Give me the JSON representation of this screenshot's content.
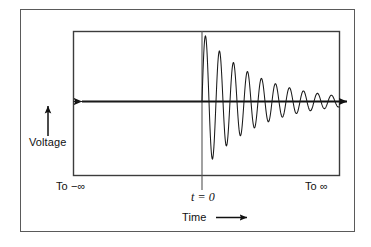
{
  "figure": {
    "background_color": "#ffffff",
    "line_color": "#1a1a1a",
    "frame_color": "#4a4a4a",
    "labels": {
      "y_axis": "Voltage",
      "x_axis": "Time",
      "left_limit": "To −∞",
      "right_limit": "To ∞",
      "origin_marker": "t = 0"
    },
    "icons": {
      "voltage_arrow": "arrow-up-icon",
      "time_arrow": "arrow-right-icon",
      "axis_left_arrow": "arrow-left-icon",
      "axis_right_arrow": "arrow-right-icon"
    }
  },
  "chart_data": {
    "type": "line",
    "title": "",
    "xlabel": "Time",
    "ylabel": "Voltage",
    "legend": [],
    "grid": false,
    "axis_arrows": [
      "left",
      "right"
    ],
    "xlim": [
      -1.0,
      1.0
    ],
    "ylim": [
      -1.05,
      1.05
    ],
    "x_tick_labels": [
      "To −∞",
      "t = 0",
      "To ∞"
    ],
    "annotations": [
      {
        "text": "To −∞",
        "x": -0.85,
        "y": -1.18
      },
      {
        "text": "t = 0",
        "x": 0.0,
        "y": -1.35
      },
      {
        "text": "To ∞",
        "x": 0.86,
        "y": -1.18
      },
      {
        "text": "Voltage",
        "x": -1.28,
        "y": 0.25
      },
      {
        "text": "Time",
        "x": -0.05,
        "y": -1.62
      }
    ],
    "waveform": {
      "form": "damped_sinusoid",
      "start_x": 0.0,
      "amplitude_initial": 1.0,
      "decay_constant": 2.55,
      "cycles_visible": 11,
      "period_px": 14.0,
      "phase": 0.0
    },
    "series": [
      {
        "name": "v(t)",
        "x": [
          -1.0,
          -0.5,
          -0.2,
          -0.05,
          0.0
        ],
        "values": [
          0,
          0,
          0,
          0,
          0
        ]
      },
      {
        "name": "v(t) damped",
        "peaks_x": [
          0.04,
          0.14,
          0.25,
          0.35,
          0.45,
          0.56,
          0.66,
          0.76,
          0.86,
          0.95
        ],
        "peaks_y": [
          0.93,
          1.0,
          0.79,
          0.63,
          0.5,
          0.38,
          0.29,
          0.22,
          0.15,
          0.07
        ],
        "troughs_x": [
          0.09,
          0.19,
          0.3,
          0.4,
          0.51,
          0.61,
          0.71,
          0.81,
          0.9,
          1.0
        ],
        "troughs_y": [
          -0.98,
          -0.86,
          -0.68,
          -0.55,
          -0.43,
          -0.33,
          -0.25,
          -0.18,
          -0.11,
          -0.05
        ]
      }
    ]
  }
}
